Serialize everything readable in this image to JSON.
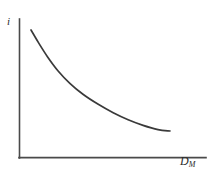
{
  "figure": {
    "title": "",
    "background_color": "#ffffff",
    "line_color": "#3a3a3a",
    "axis_color": "#4a4a4a"
  },
  "axes": {
    "y_label": "i",
    "x_label_base": "D",
    "x_label_subscript": "M"
  },
  "chart_data": {
    "type": "line",
    "title": "",
    "xlabel": "D_M",
    "ylabel": "i",
    "xlim": [
      0,
      100
    ],
    "ylim": [
      0,
      100
    ],
    "grid": false,
    "legend": null,
    "axis_ticks": {
      "x": [],
      "y": []
    },
    "series": [
      {
        "name": "Money demand curve",
        "color": "#3a3a3a",
        "x": [
          7,
          12,
          18,
          25,
          33,
          42,
          52,
          62,
          72,
          82,
          92,
          100
        ],
        "y": [
          92,
          83,
          73,
          63,
          54,
          46,
          39,
          33,
          28,
          24,
          21,
          20
        ]
      }
    ],
    "annotations": []
  }
}
